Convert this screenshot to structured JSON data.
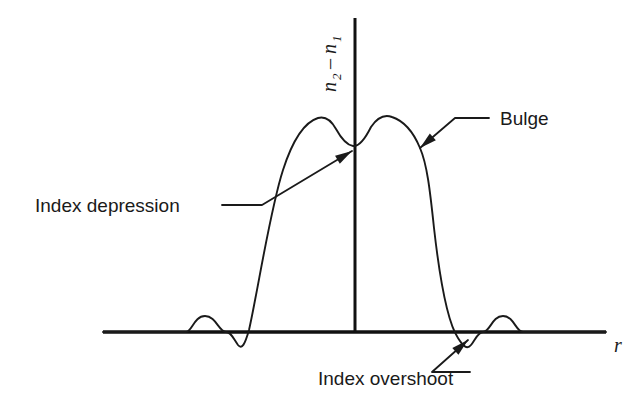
{
  "figure": {
    "name": "refractive-index-profile-diagram",
    "background_color": "#ffffff",
    "line_color": "#1a1a1a",
    "width": 643,
    "height": 407
  },
  "axes": {
    "x_axis": {
      "label": "r",
      "label_x": 614,
      "label_y": 352,
      "x_start": 103,
      "x_end": 606,
      "y": 332,
      "stroke_width": 3.4
    },
    "y_axis": {
      "label_parts": {
        "n_first": "n",
        "sub_first": "2",
        "minus": "–",
        "n_second": "n",
        "sub_second": "1"
      },
      "label_full": "n2 – n1",
      "x": 355,
      "y_top": 18,
      "y_bottom": 332,
      "stroke_width": 3.0
    }
  },
  "annotations": [
    {
      "id": "index-depression",
      "label": "Index depression",
      "text_x": 35,
      "text_y": 212,
      "leader": "M 222 205 L 262 205 L 352 151",
      "arrow_tip": [
        352,
        151
      ],
      "arrow_angle": -31
    },
    {
      "id": "bulge",
      "label": "Bulge",
      "text_x": 500,
      "text_y": 125,
      "leader": "M 489 118 L 455 118 L 420 148",
      "arrow_tip": [
        420,
        148
      ],
      "arrow_angle": 139
    },
    {
      "id": "index-overshoot",
      "label": "Index overshoot",
      "text_x": 318,
      "text_y": 385,
      "leader": "M 470 372 L 432 372 L 468 340",
      "arrow_tip": [
        468,
        340
      ],
      "arrow_angle": -42
    }
  ],
  "chart_data": {
    "type": "line",
    "title": "",
    "xlabel": "r",
    "ylabel": "n2 – n1",
    "grid": false,
    "legend": false,
    "features": [
      {
        "name": "outer ripple left",
        "x_px": 205,
        "y_px": 318,
        "type": "small positive bump"
      },
      {
        "name": "index overshoot left",
        "x_px": 237,
        "y_px": 345,
        "type": "dip below baseline"
      },
      {
        "name": "bulge left peak",
        "x_px": 328,
        "y_px": 118,
        "type": "local maximum"
      },
      {
        "name": "index depression",
        "x_px": 355,
        "y_px": 145,
        "type": "central local minimum"
      },
      {
        "name": "bulge right peak",
        "x_px": 385,
        "y_px": 118,
        "type": "local maximum"
      },
      {
        "name": "plateau right",
        "x_px": 430,
        "y_px": 140,
        "type": "shoulder"
      },
      {
        "name": "index overshoot right",
        "x_px": 470,
        "y_px": 345,
        "type": "dip below baseline"
      },
      {
        "name": "outer ripple right",
        "x_px": 502,
        "y_px": 318,
        "type": "small positive bump"
      }
    ],
    "curve_path": "M 103 332 L 186 332 C 192 332 194 316 205 316 C 216 316 219 332 226 332 C 231 332 233 338 238 345 C 242 350 245 344 249 330 C 258 290 270 210 283 170 C 293 139 305 122 318 118 C 325 116 331 120 336 129 C 341 138 346 145 353 146 C 360 147 366 137 371 127 C 377 118 384 114 392 117 C 404 121 413 131 420 148 C 427 164 430 190 434 228 C 441 290 450 326 458 338 C 463 346 467 350 471 345 C 475 340 478 332 483 332 C 490 332 492 316 503 316 C 514 316 516 332 523 332 L 606 332",
    "baseline_y_px": 332,
    "axis_x_px": 355
  }
}
